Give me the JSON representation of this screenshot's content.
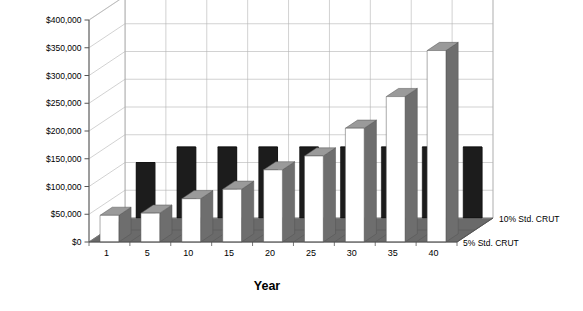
{
  "chart_data": {
    "type": "bar",
    "title": "",
    "xlabel": "Year",
    "ylabel": "",
    "ylim": [
      0,
      400000
    ],
    "ytick_values": [
      0,
      50000,
      100000,
      150000,
      200000,
      250000,
      300000,
      350000,
      400000
    ],
    "ytick_labels": [
      "$0",
      "$50,000",
      "$100,000",
      "$150,000",
      "$200,000",
      "$250,000",
      "$300,000",
      "$350,000",
      "$400,000"
    ],
    "categories": [
      "1",
      "5",
      "10",
      "15",
      "20",
      "25",
      "30",
      "35",
      "40"
    ],
    "grid": true,
    "projection": "3d",
    "legend_position": "right-floor-axis",
    "series": [
      {
        "name": "10% Std. CRUT",
        "color": "#1c1c1c",
        "values": [
          100000,
          128000,
          128000,
          128000,
          128000,
          128000,
          128000,
          128000,
          128000
        ]
      },
      {
        "name": "5% Std. CRUT",
        "color": "#ffffff",
        "values": [
          48000,
          52000,
          78000,
          95000,
          130000,
          155000,
          205000,
          262000,
          345000
        ]
      }
    ]
  },
  "series_axis_labels": [
    "10% Std. CRUT",
    "5% Std. CRUT"
  ],
  "colors": {
    "back_series": "#1c1c1c",
    "front_series": "#ffffff",
    "bar_top": "#9a9a9a",
    "bar_side": "#6e6e6e",
    "dark_bar_top": "#4a4a4a",
    "dark_bar_side": "#2e2e2e",
    "floor": "#6a6a6a",
    "grid": "#b4b4b4",
    "axis": "#555555"
  }
}
